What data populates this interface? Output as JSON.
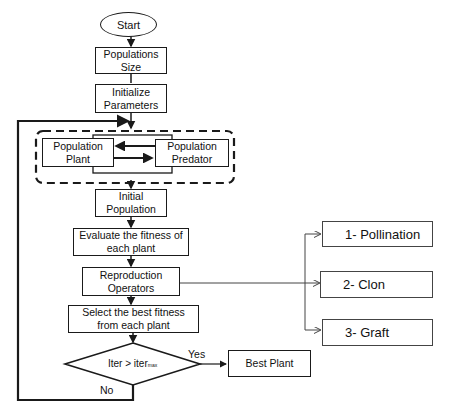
{
  "flowchart": {
    "start": "Start",
    "populations_size": "Populations Size",
    "initialize_parameters": "Initialize Parameters",
    "population_plant": "Population Plant",
    "population_predator": "Population Predator",
    "initial_population": "Initial Population",
    "evaluate_fitness": "Evaluate the fitness of each plant",
    "reproduction_operators": "Reproduction Operators",
    "select_best": "Select the best fitness from each plant",
    "decision": {
      "lhs": "Iter > iter",
      "subscript": "max"
    },
    "yes_label": "Yes",
    "no_label": "No",
    "best_plant": "Best Plant",
    "operators": [
      {
        "label": "1- Pollination"
      },
      {
        "label": "2- Clon"
      },
      {
        "label": "3- Graft"
      }
    ]
  },
  "colors": {
    "stroke": "#1a1a1a",
    "background": "#ffffff"
  }
}
